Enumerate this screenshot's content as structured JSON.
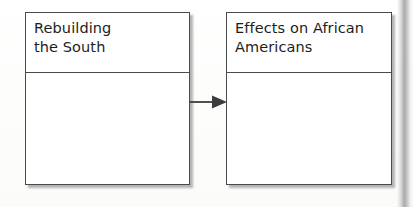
{
  "diagram": {
    "type": "flow-sequence",
    "background_color": "#fdfdfd",
    "box_border_color": "#4a4a4a",
    "text_color": "#1d1d1d",
    "nodes": [
      {
        "id": "rebuilding-the-south",
        "title": "Rebuilding\nthe South",
        "body": ""
      },
      {
        "id": "effects-on-african-americans",
        "title": "Effects on African\nAmericans",
        "body": ""
      }
    ],
    "connectors": [
      {
        "id": "arrow-left-to-right",
        "icon": "arrow-right-icon",
        "from": "rebuilding-the-south",
        "to": "effects-on-african-americans"
      }
    ]
  }
}
